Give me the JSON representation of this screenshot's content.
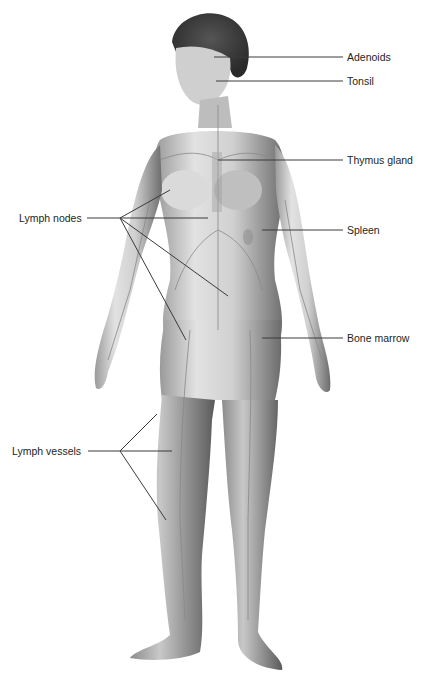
{
  "diagram": {
    "labels_right": [
      {
        "id": "adenoids",
        "text": "Adenoids",
        "x": 347,
        "y": 52
      },
      {
        "id": "tonsil",
        "text": "Tonsil",
        "x": 347,
        "y": 76
      },
      {
        "id": "thymus",
        "text": "Thymus gland",
        "x": 347,
        "y": 155
      },
      {
        "id": "spleen",
        "text": "Spleen",
        "x": 347,
        "y": 225
      },
      {
        "id": "bone-marrow",
        "text": "Bone marrow",
        "x": 347,
        "y": 332
      }
    ],
    "labels_left": [
      {
        "id": "lymph-nodes",
        "text": "Lymph nodes",
        "x": 19,
        "y": 212
      },
      {
        "id": "lymph-vessels",
        "text": "Lymph vessels",
        "x": 12,
        "y": 445
      }
    ],
    "colors": {
      "line": "#3a3a3a",
      "text": "#231f20",
      "skin_light": "#e6e6e6",
      "skin_dark": "#7a7a7a",
      "hair": "#3d3d3d",
      "vessel": "#8a8a8a"
    }
  }
}
